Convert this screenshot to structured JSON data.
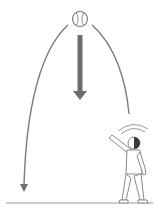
{
  "diagram": {
    "colors": {
      "background": "#ffffff",
      "line": "#7a7a7a",
      "arrow": "#6e6e6e",
      "figure_stroke": "#8a8a8a",
      "head_fill": "#3a3a3a",
      "ground": "#9a9a9a"
    },
    "elements": [
      {
        "name": "ball",
        "icon": "baseball-icon"
      },
      {
        "name": "gravity-arrow",
        "icon": "arrow-down-icon"
      },
      {
        "name": "left-trajectory",
        "icon": "curved-arrow-icon"
      },
      {
        "name": "right-trajectory",
        "icon": "curved-line-icon"
      },
      {
        "name": "person",
        "icon": "person-waving-icon"
      },
      {
        "name": "sound-waves",
        "icon": "sound-waves-icon"
      },
      {
        "name": "ground",
        "icon": "ground-line-icon"
      }
    ]
  }
}
